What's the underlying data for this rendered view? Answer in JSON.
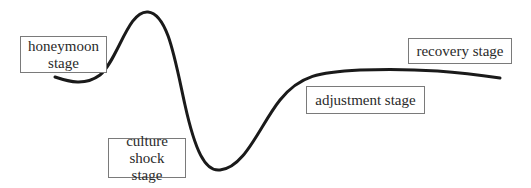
{
  "diagram": {
    "type": "culture-shock-curve",
    "stages": [
      {
        "id": "honeymoon",
        "lines": [
          "honeymoon",
          "stage"
        ]
      },
      {
        "id": "culture-shock",
        "lines": [
          "culture shock",
          "stage"
        ]
      },
      {
        "id": "adjustment",
        "lines": [
          "adjustment stage"
        ]
      },
      {
        "id": "recovery",
        "lines": [
          "recovery stage"
        ]
      }
    ],
    "colors": {
      "curve": "#1a1a1a",
      "box_border": "#7a7a7a",
      "text": "#2a2a2a"
    }
  }
}
